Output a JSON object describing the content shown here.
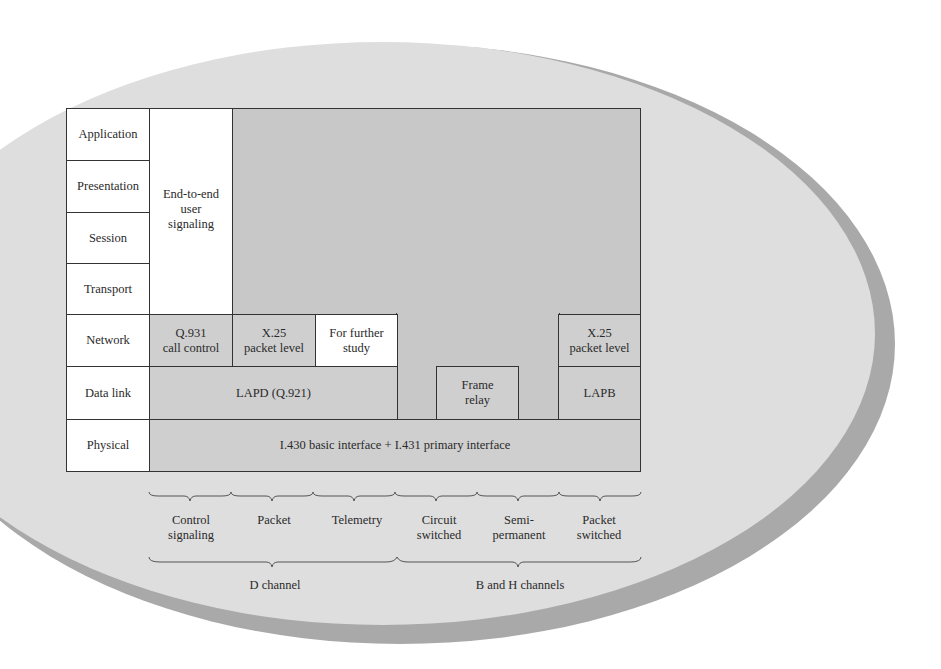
{
  "osi_layers": [
    "Application",
    "Presentation",
    "Session",
    "Transport",
    "Network",
    "Data link",
    "Physical"
  ],
  "blocks": {
    "end_to_end": "End-to-end\nuser\nsignaling",
    "q931": "Q.931\ncall control",
    "x25_d": "X.25\npacket level",
    "further_study": "For further\nstudy",
    "x25_b": "X.25\npacket level",
    "lapd": "LAPD (Q.921)",
    "frame_relay": "Frame\nrelay",
    "lapb": "LAPB",
    "physical": "I.430 basic interface + I.431 primary interface"
  },
  "services": [
    "Control\nsignaling",
    "Packet",
    "Telemetry",
    "Circuit\nswitched",
    "Semi-\npermanent",
    "Packet\nswitched"
  ],
  "channels": [
    "D channel",
    "B and H channels"
  ],
  "colors": {
    "background_oval": "#dedede",
    "oval_shadow": "#a9a9a9",
    "shaded_cell": "#cfcfcf",
    "white_cell": "#ffffff",
    "border": "#333333"
  }
}
